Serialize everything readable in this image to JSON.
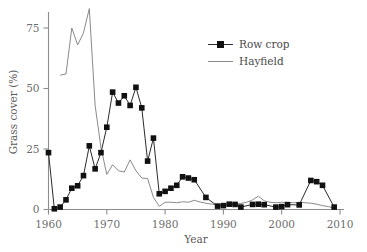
{
  "chart_data": {
    "type": "line",
    "title": "",
    "xlabel": "Year",
    "ylabel": "Grass cover (%)",
    "xlim": [
      1960,
      2010
    ],
    "ylim": [
      0,
      87
    ],
    "xticks": [
      1960,
      1970,
      1980,
      1990,
      2000,
      2010
    ],
    "xtick_labels": [
      "1960",
      "1970",
      "1980",
      "1990",
      "2000",
      "2010"
    ],
    "yticks": [
      0,
      25,
      50,
      75
    ],
    "ytick_labels": [
      "0",
      "25",
      "50",
      "75"
    ],
    "grid": false,
    "legend_position": "top-right",
    "series": [
      {
        "name": "Row crop",
        "marker": "square",
        "color": "#111111",
        "x": [
          1960,
          1961,
          1962,
          1963,
          1964,
          1965,
          1966,
          1967,
          1968,
          1969,
          1970,
          1971,
          1972,
          1973,
          1974,
          1975,
          1976,
          1977,
          1978,
          1979,
          1980,
          1981,
          1982,
          1983,
          1984,
          1985,
          1987,
          1989,
          1990,
          1991,
          1992,
          1993,
          1995,
          1996,
          1997,
          1999,
          2000,
          2001,
          2003,
          2005,
          2006,
          2007,
          2009
        ],
        "values": [
          23.5,
          0.3,
          1.0,
          4.0,
          8.8,
          9.8,
          14.0,
          26.3,
          16.8,
          23.5,
          34.0,
          48.5,
          44.0,
          47.0,
          43.0,
          50.5,
          42.0,
          20.0,
          29.5,
          6.5,
          7.5,
          8.8,
          10.0,
          13.5,
          13.0,
          12.3,
          5.0,
          1.4,
          1.6,
          2.2,
          2.1,
          1.0,
          2.1,
          2.2,
          2.0,
          1.0,
          1.2,
          2.0,
          1.9,
          12.0,
          11.5,
          10.0,
          1.0
        ]
      },
      {
        "name": "Hayfield",
        "marker": "none",
        "color": "#8a8a8a",
        "x": [
          1962,
          1963,
          1964,
          1965,
          1966,
          1967,
          1968,
          1969,
          1970,
          1971,
          1972,
          1973,
          1974,
          1975,
          1976,
          1977,
          1978,
          1979,
          1980,
          1981,
          1982,
          1983,
          1984,
          1985,
          1986,
          1987,
          1988,
          1989,
          1990,
          1991,
          1992,
          1993,
          1994,
          1995,
          1996,
          1997,
          1998,
          1999,
          2000,
          2001,
          2002,
          2003,
          2004,
          2005,
          2006,
          2007,
          2008,
          2009
        ],
        "values": [
          55.5,
          56.0,
          75.0,
          68.0,
          73.0,
          83.0,
          43.0,
          25.5,
          14.5,
          18.5,
          16.0,
          15.5,
          20.5,
          16.0,
          13.0,
          12.8,
          5.0,
          1.3,
          3.0,
          3.0,
          2.8,
          3.2,
          3.0,
          3.8,
          3.1,
          2.6,
          2.2,
          2.0,
          2.0,
          2.2,
          2.6,
          2.5,
          3.0,
          4.0,
          5.5,
          3.6,
          3.0,
          2.8,
          3.0,
          2.9,
          2.8,
          3.0,
          2.8,
          2.6,
          2.2,
          1.6,
          1.2,
          0.6
        ]
      }
    ]
  },
  "legend": {
    "entries": [
      {
        "label": "Row crop"
      },
      {
        "label": "Hayfield"
      }
    ]
  }
}
